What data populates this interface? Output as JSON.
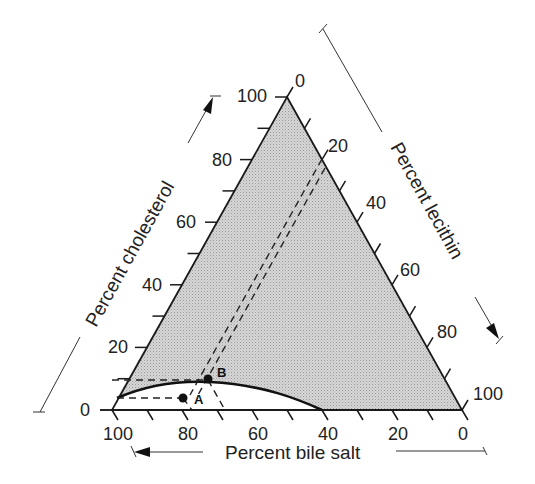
{
  "diagram": {
    "type": "ternary",
    "colors": {
      "shaded_region": "#d4d4d4",
      "lines": "#1a1a1a",
      "background": "#ffffff"
    },
    "axes": {
      "cholesterol": {
        "title": "Percent cholesterol",
        "ticks": [
          "0",
          "20",
          "40",
          "60",
          "80",
          "100"
        ],
        "direction": "increasing upward (arrow points up)"
      },
      "lecithin": {
        "title": "Percent lecithin",
        "ticks": [
          "0",
          "20",
          "40",
          "60",
          "80",
          "100"
        ],
        "direction": "increasing downward-right (arrow points down)"
      },
      "bile_salt": {
        "title": "Percent bile salt",
        "ticks": [
          "100",
          "80",
          "60",
          "40",
          "20",
          "0"
        ],
        "direction": "increasing leftward (arrow points left)"
      }
    },
    "points": [
      {
        "label": "A",
        "cholesterol": 5,
        "lecithin": 15,
        "bile_salt": 80,
        "region": "below curve (micellar liquid)"
      },
      {
        "label": "B",
        "cholesterol": 10,
        "lecithin": 20,
        "bile_salt": 70,
        "region": "on/above curve"
      }
    ],
    "regions": [
      {
        "name": "shaded",
        "description": "above solubility curve (supersaturated / crystals)"
      },
      {
        "name": "unshaded",
        "description": "below curve (single liquid phase)"
      }
    ],
    "curve": {
      "description": "cholesterol solubility boundary from bile salt axis (~5% cholesterol at 100% bile salt) peaking ~9% near 75% bile salt, reaching base at 40% bile salt"
    }
  }
}
